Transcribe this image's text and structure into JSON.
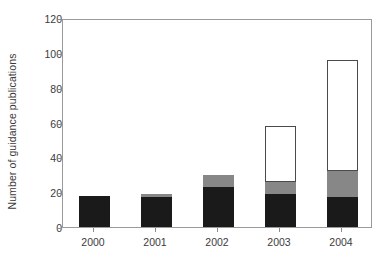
{
  "chart_data": {
    "type": "bar",
    "title": "",
    "subtitle": "",
    "xlabel": "",
    "ylabel": "Number of guidance publications",
    "categories": [
      "2000",
      "2001",
      "2002",
      "2003",
      "2004"
    ],
    "ylim": [
      0,
      120
    ],
    "yticks": [
      0,
      20,
      40,
      60,
      80,
      100,
      120
    ],
    "ytick_labels": [
      "0",
      "20",
      "40",
      "60",
      "80",
      "100",
      "120"
    ],
    "grid": false,
    "legend": false,
    "legend_position": "none",
    "stacked": true,
    "series": [
      {
        "name": "black-segment",
        "color": "#1a1a1a",
        "values": [
          18,
          17,
          23,
          19,
          17
        ]
      },
      {
        "name": "gray-segment",
        "color": "#878787",
        "values": [
          0,
          2,
          7,
          7,
          15
        ]
      },
      {
        "name": "white-segment",
        "color": "#ffffff",
        "values": [
          0,
          0,
          0,
          32,
          64
        ]
      }
    ],
    "totals": [
      18,
      19,
      30,
      58,
      96
    ]
  },
  "axes": {
    "frame_color": "#9a9a9a",
    "tick_color": "#8d8d8d",
    "text_color": "#3b3b3b"
  }
}
